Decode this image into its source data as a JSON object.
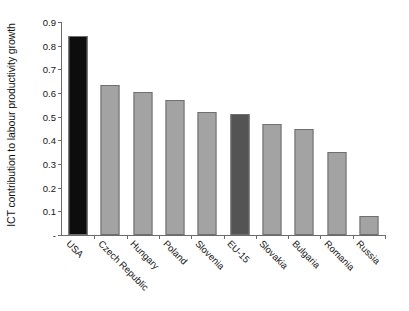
{
  "chart_data": {
    "type": "bar",
    "title": "",
    "xlabel": "",
    "ylabel": "ICT contribution to labour productivity growth",
    "categories": [
      "USA",
      "Czech Republic",
      "Hungary",
      "Poland",
      "Slovenia",
      "EU-15",
      "Slovakia",
      "Bulgaria",
      "Romania",
      "Russia"
    ],
    "values": [
      0.84,
      0.635,
      0.605,
      0.57,
      0.52,
      0.51,
      0.47,
      0.45,
      0.35,
      0.08
    ],
    "bar_colors": [
      "#0d0d0d",
      "#a3a3a3",
      "#a3a3a3",
      "#a3a3a3",
      "#a3a3a3",
      "#545454",
      "#a3a3a3",
      "#a3a3a3",
      "#a3a3a3",
      "#a3a3a3"
    ],
    "ylim": [
      0,
      0.9
    ],
    "ytick_values": [
      0,
      0.1,
      0.2,
      0.3,
      0.4,
      0.5,
      0.6,
      0.7,
      0.8,
      0.9
    ],
    "ytick_labels": [
      "-",
      "0.1",
      "0.2",
      "0.3",
      "0.4",
      "0.5",
      "0.6",
      "0.7",
      "0.8",
      "0.9"
    ],
    "grid": false,
    "legend": null,
    "xlabel_rotation_deg": 45,
    "axis_color": "#6b6b6b",
    "background_color": "#ffffff"
  }
}
